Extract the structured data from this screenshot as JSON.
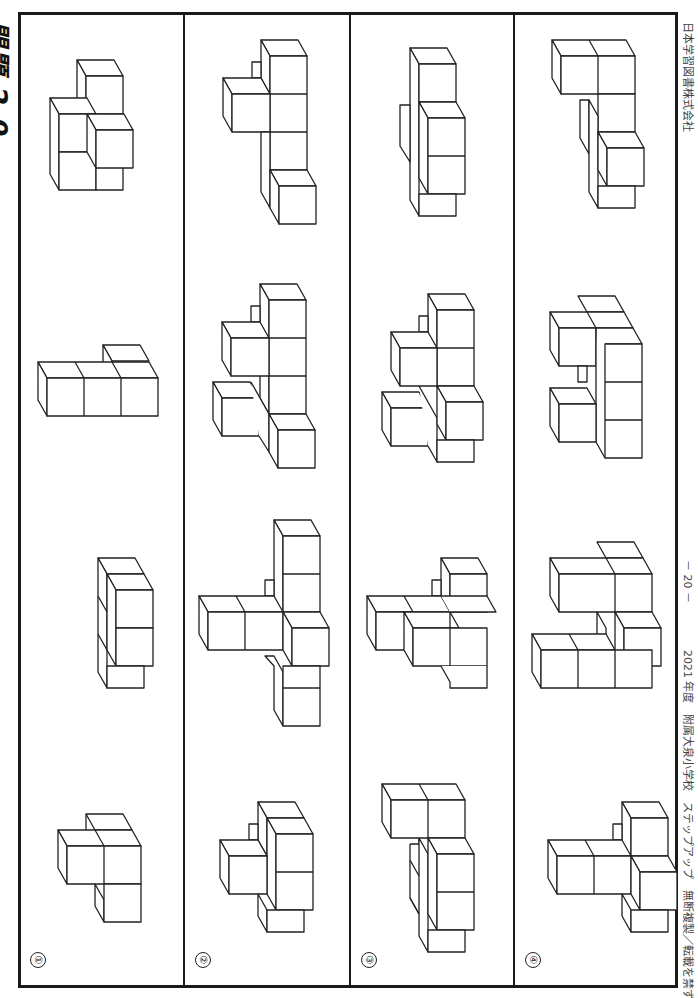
{
  "page": {
    "title": "問題 2 0",
    "footer_left": "2021 年度　附属大泉小学校　ステップアップ　無断複製／転載を禁ずる",
    "page_number": "－ 20 －",
    "publisher": "日本学習図書株式会社"
  },
  "rows": [
    {
      "label": "①",
      "number": 1
    },
    {
      "label": "②",
      "number": 2
    },
    {
      "label": "③",
      "number": 3
    },
    {
      "label": "④",
      "number": 4
    }
  ],
  "figures": [
    {
      "id": "r1-f1",
      "row": 1,
      "x": 55,
      "y": 57,
      "cubes": [
        [
          0,
          0
        ],
        [
          1,
          0
        ],
        [
          2,
          0
        ],
        [
          3,
          1
        ],
        [
          4,
          1
        ]
      ],
      "desc": "5-cube stack"
    },
    {
      "id": "r1-f2",
      "row": 1,
      "x": 40,
      "y": 347,
      "cubes": [
        [
          0,
          0
        ],
        [
          1,
          0
        ],
        [
          2,
          0
        ],
        [
          2,
          1
        ]
      ],
      "desc": "4-cube L row"
    },
    {
      "id": "r1-f3",
      "row": 1,
      "x": 98,
      "y": 558,
      "cubes": [
        [
          0,
          0
        ],
        [
          1,
          0
        ],
        [
          2,
          0
        ],
        [
          3,
          0
        ]
      ],
      "desc": "column of cubes"
    },
    {
      "id": "r1-f4",
      "row": 1,
      "x": 58,
      "y": 815,
      "cubes": [
        [
          0,
          0
        ],
        [
          1,
          0
        ],
        [
          2,
          0
        ],
        [
          3,
          0
        ]
      ],
      "desc": "4-cube bent stack"
    }
  ],
  "colors": {
    "line": "#222222",
    "frame": "#1a1a1a",
    "text": "#444444",
    "background": "#ffffff"
  }
}
